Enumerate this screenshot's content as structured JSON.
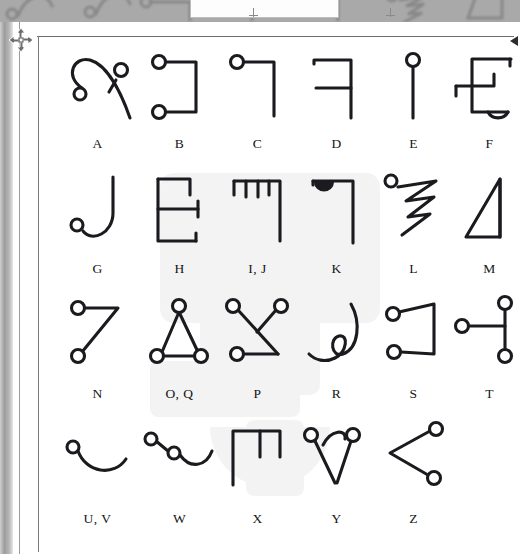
{
  "page": {
    "background_color": "#ffffff",
    "stroke_color": "#1b1b1f",
    "rule_color": "#6e6e6e"
  },
  "chrome": {
    "top_strip_color": "#a9a9a9",
    "left_edge_color": "#9c9c9c",
    "move_cursor_icon": "move-4way-icon",
    "right_marker_icon": "left-arrow-icon",
    "ghost_row_text": "I, J            K"
  },
  "watermark": {
    "icon": "letter-g-watermark",
    "opacity": "0.055"
  },
  "grid": {
    "columns": 6,
    "rows": [
      {
        "cells": [
          {
            "label": "A",
            "glyph": "glyph-a"
          },
          {
            "label": "B",
            "glyph": "glyph-b"
          },
          {
            "label": "C",
            "glyph": "glyph-c"
          },
          {
            "label": "D",
            "glyph": "glyph-d"
          },
          {
            "label": "E",
            "glyph": "glyph-e"
          },
          {
            "label": "F",
            "glyph": "glyph-f"
          }
        ]
      },
      {
        "cells": [
          {
            "label": "G",
            "glyph": "glyph-g"
          },
          {
            "label": "H",
            "glyph": "glyph-h"
          },
          {
            "label": "I, J",
            "glyph": "glyph-ij"
          },
          {
            "label": "K",
            "glyph": "glyph-k"
          },
          {
            "label": "L",
            "glyph": "glyph-l"
          },
          {
            "label": "M",
            "glyph": "glyph-m"
          }
        ]
      },
      {
        "cells": [
          {
            "label": "N",
            "glyph": "glyph-n"
          },
          {
            "label": "O, Q",
            "glyph": "glyph-oq"
          },
          {
            "label": "P",
            "glyph": "glyph-p"
          },
          {
            "label": "R",
            "glyph": "glyph-r"
          },
          {
            "label": "S",
            "glyph": "glyph-s"
          },
          {
            "label": "T",
            "glyph": "glyph-t"
          }
        ]
      },
      {
        "cells": [
          {
            "label": "U, V",
            "glyph": "glyph-uv"
          },
          {
            "label": "W",
            "glyph": "glyph-w"
          },
          {
            "label": "X",
            "glyph": "glyph-x"
          },
          {
            "label": "Y",
            "glyph": "glyph-y"
          },
          {
            "label": "Z",
            "glyph": "glyph-z"
          },
          {
            "label": "",
            "glyph": ""
          }
        ]
      }
    ]
  }
}
